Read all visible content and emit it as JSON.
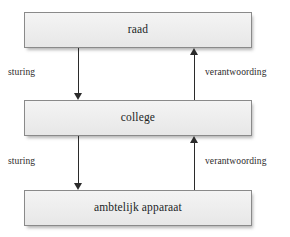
{
  "diagram": {
    "type": "governance-flow",
    "background_color": "#ffffff",
    "node_fill_color": "#ededed",
    "node_border_color": "#8a8a8a",
    "arrow_color": "#2b2b2b",
    "text_color": "#221f1f",
    "nodes": [
      {
        "id": "raad",
        "label": "raad"
      },
      {
        "id": "college",
        "label": "college"
      },
      {
        "id": "ambt",
        "label": "ambtelijk apparaat"
      }
    ],
    "edges": [
      {
        "id": "raad-college",
        "from": "raad",
        "to": "college",
        "direction": "down",
        "label": "sturing"
      },
      {
        "id": "college-raad",
        "from": "college",
        "to": "raad",
        "direction": "up",
        "label": "verantwoording"
      },
      {
        "id": "college-ambt",
        "from": "college",
        "to": "ambt",
        "direction": "down",
        "label": "sturing"
      },
      {
        "id": "ambt-college",
        "from": "ambt",
        "to": "college",
        "direction": "up",
        "label": "verantwoording"
      }
    ]
  }
}
